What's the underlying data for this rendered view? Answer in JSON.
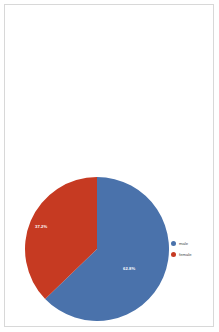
{
  "page": {
    "background_color": "#ffffff",
    "border_color": "#d8d8d8"
  },
  "legend": {
    "position": "right",
    "items": [
      {
        "label": "male",
        "color": "#4a72ab",
        "marker": "circle-marker"
      },
      {
        "label": "female",
        "color": "#c63a22",
        "marker": "circle-marker"
      }
    ]
  },
  "labels": {
    "male_pct": "62.8%",
    "female_pct": "37.2%"
  },
  "chart_data": {
    "type": "pie",
    "title": "",
    "subtitle": "",
    "xlabel": "",
    "ylabel": "",
    "categories": [
      "male",
      "female"
    ],
    "values": [
      62.8,
      37.2
    ],
    "value_labels": [
      "62.8%",
      "37.2%"
    ],
    "colors": [
      "#4a72ab",
      "#c63a22"
    ],
    "units": "percent",
    "total": 100,
    "start_angle_deg": 0,
    "direction": "clockwise",
    "legend_position": "right",
    "grid": false,
    "data_labels_shown": true,
    "data_label_color": "#ffffff"
  }
}
